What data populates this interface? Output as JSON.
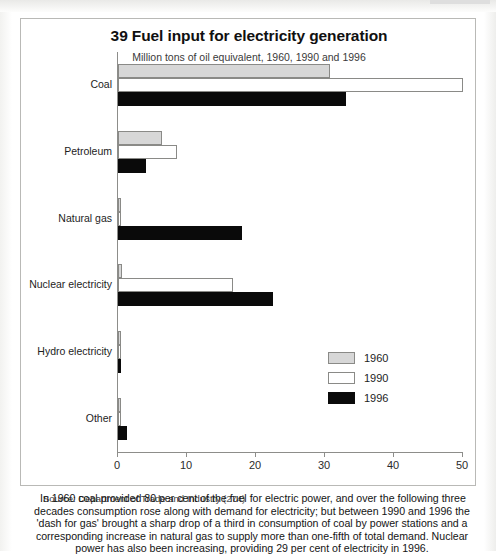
{
  "figure": {
    "title": "39 Fuel input for electricity generation",
    "subtitle": "Million tons of oil equivalent, 1960, 1990 and 1996",
    "source_label": "Source: Department of Trade and Industry",
    "source_ref": "(274)"
  },
  "caption": {
    "line1": "In 1960 coal provided 80 per cent of the fuel for electric power, and over the following three",
    "line2": "decades consumption rose along with demand for electricity; but between 1990 and 1996 the",
    "line3": "'dash for gas' brought a sharp drop of a third in consumption of coal by power stations and a",
    "line4": "corresponding increase in natural gas to supply more than one-fifth of total demand. Nuclear",
    "line5": "power has also been increasing, providing 29 per cent of electricity in 1996."
  },
  "legend": {
    "items": [
      {
        "label": "1960",
        "key": "y1960",
        "color": "#d7d7d7"
      },
      {
        "label": "1990",
        "key": "y1990",
        "color": "#ffffff"
      },
      {
        "label": "1996",
        "key": "y1996",
        "color": "#0a0a0a"
      }
    ]
  },
  "axis": {
    "ticks": [
      {
        "label": "0",
        "value": 0
      },
      {
        "label": "10",
        "value": 10
      },
      {
        "label": "20",
        "value": 20
      },
      {
        "label": "30",
        "value": 30
      },
      {
        "label": "40",
        "value": 40
      },
      {
        "label": "50",
        "value": 50
      }
    ]
  },
  "chart_data": {
    "type": "bar",
    "orientation": "horizontal",
    "title": "39 Fuel input for electricity generation",
    "subtitle": "Million tons of oil equivalent, 1960, 1990 and 1996",
    "xlabel": "Million tons of oil equivalent",
    "ylabel": "",
    "xlim": [
      0,
      50
    ],
    "xticks": [
      0,
      10,
      20,
      30,
      40,
      50
    ],
    "grid": false,
    "legend_position": "bottom-right",
    "categories": [
      "Coal",
      "Petroleum",
      "Natural gas",
      "Nuclear electricity",
      "Hydro electricity",
      "Other"
    ],
    "series": [
      {
        "name": "1960",
        "color": "#d7d7d7",
        "values": [
          30.7,
          6.4,
          0.1,
          0.6,
          0.4,
          0.4
        ]
      },
      {
        "name": "1990",
        "color": "#ffffff",
        "values": [
          50.0,
          8.5,
          0.5,
          16.7,
          0.4,
          0.4
        ]
      },
      {
        "name": "1996",
        "color": "#0a0a0a",
        "values": [
          33.0,
          4.0,
          18.0,
          22.5,
          0.4,
          1.3
        ]
      }
    ]
  }
}
